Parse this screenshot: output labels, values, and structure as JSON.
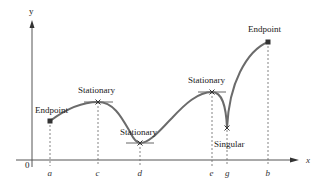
{
  "diagram": {
    "axes": {
      "x_label": "x",
      "y_label": "y",
      "origin_label": "0"
    },
    "colors": {
      "curve": "#6b6b6b",
      "axis": "#555555",
      "dashed": "#666666",
      "text": "#222222"
    },
    "points": [
      {
        "id": "a",
        "tick_label": "a",
        "type": "Endpoint",
        "label": "Endpoint",
        "marker": "square"
      },
      {
        "id": "c",
        "tick_label": "c",
        "type": "Stationary",
        "label": "Stationary",
        "marker": "cross"
      },
      {
        "id": "d",
        "tick_label": "d",
        "type": "Stationary",
        "label": "Stationary",
        "marker": "cross"
      },
      {
        "id": "e",
        "tick_label": "e",
        "type": "Stationary",
        "label": "Stationary",
        "marker": "cross"
      },
      {
        "id": "g",
        "tick_label": "g",
        "type": "Singular",
        "label": "Singular",
        "marker": "cross"
      },
      {
        "id": "b",
        "tick_label": "b",
        "type": "Endpoint",
        "label": "Endpoint",
        "marker": "square"
      }
    ]
  }
}
